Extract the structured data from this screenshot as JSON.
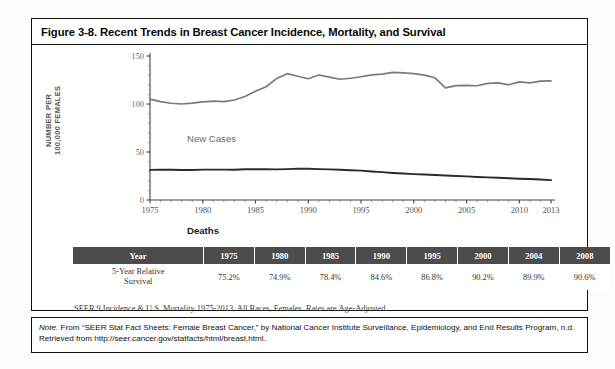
{
  "figure": {
    "title": "Figure 3-8. Recent Trends in Breast Cancer Incidence, Mortality, and Survival",
    "source_note": "SEER 9 Incidence & U.S. Mortality 1975-2013, All Races, Females. Rates are Age-Adjusted.",
    "bottom_note_label": "Note.",
    "bottom_note": " From “SEER Stat Fact Sheets: Female Breast Cancer,” by National Cancer Institute Surveillance, Epidemiology, and End Results Program, n.d. Retrieved from http://seer.cancer.gov/statfacts/html/breast.html."
  },
  "colors": {
    "incidence_line": "#7a7a7a",
    "mortality_line": "#2b2b2b",
    "table_header_bg": "#4c4c4c",
    "table_header_text": "#ffffff",
    "border": "#111111"
  },
  "chart_data": {
    "type": "line",
    "title": "",
    "xlabel": "",
    "ylabel": "NUMBER PER 100,000 FEMALES",
    "ylabel_line1": "NUMBER PER",
    "ylabel_line2": "100,000 FEMALES",
    "xlim": [
      1975,
      2013
    ],
    "ylim": [
      0,
      150
    ],
    "yticks": [
      0,
      50,
      100,
      150
    ],
    "ytick_labels": [
      "0",
      "50",
      "100",
      "150"
    ],
    "xticks": [
      1975,
      1980,
      1985,
      1990,
      1995,
      2000,
      2005,
      2010,
      2013
    ],
    "xtick_labels": [
      "1975",
      "1980",
      "1985",
      "1990",
      "1995",
      "2000",
      "2005",
      "2010",
      "2013"
    ],
    "minor_xtick_interval": 1,
    "grid": false,
    "legend": "inline-labels",
    "x": [
      1975,
      1976,
      1977,
      1978,
      1979,
      1980,
      1981,
      1982,
      1983,
      1984,
      1985,
      1986,
      1987,
      1988,
      1989,
      1990,
      1991,
      1992,
      1993,
      1994,
      1995,
      1996,
      1997,
      1998,
      1999,
      2000,
      2001,
      2002,
      2003,
      2004,
      2005,
      2006,
      2007,
      2008,
      2009,
      2010,
      2011,
      2012,
      2013
    ],
    "series": [
      {
        "name": "New Cases",
        "label": "New Cases",
        "color": "#7a7a7a",
        "values": [
          105.1,
          102.4,
          100.8,
          100.0,
          100.9,
          102.2,
          103.0,
          102.4,
          104.2,
          107.8,
          113.2,
          118.0,
          126.5,
          131.6,
          128.9,
          126.3,
          130.2,
          128.0,
          125.8,
          126.8,
          128.4,
          130.4,
          131.2,
          133.0,
          132.4,
          131.6,
          130.0,
          127.3,
          116.8,
          119.2,
          119.5,
          119.0,
          121.5,
          122.0,
          120.0,
          123.0,
          122.0,
          123.8,
          124.0
        ]
      },
      {
        "name": "Deaths",
        "label": "Deaths",
        "color": "#2b2b2b",
        "values": [
          31.4,
          31.5,
          31.5,
          31.2,
          31.3,
          31.6,
          31.6,
          31.6,
          31.5,
          32.0,
          32.1,
          32.0,
          31.9,
          32.2,
          32.7,
          32.6,
          32.2,
          31.9,
          31.5,
          31.0,
          30.6,
          29.7,
          29.0,
          28.2,
          27.6,
          27.0,
          26.5,
          26.0,
          25.5,
          25.0,
          24.6,
          24.0,
          23.6,
          23.2,
          22.6,
          22.2,
          21.9,
          21.4,
          20.7
        ]
      }
    ]
  },
  "table": {
    "columns": [
      "Year",
      "1975",
      "1980",
      "1985",
      "1990",
      "1995",
      "2000",
      "2004",
      "2008"
    ],
    "row_label_line1": "5-Year Relative",
    "row_label_line2": "Survival",
    "values": [
      "75.2%",
      "74.9%",
      "78.4%",
      "84.6%",
      "86.8%",
      "90.2%",
      "89.9%",
      "90.6%"
    ]
  }
}
